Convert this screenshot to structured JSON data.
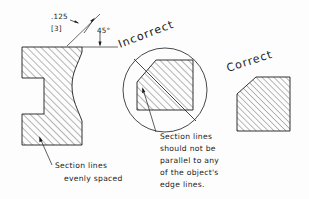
{
  "drawing": {
    "title": "Section lines (hatching) convention illustration",
    "background_color": "#fdfdfd",
    "line_color": "#1b1b1b",
    "dimension": {
      "value_inch": ".125",
      "value_metric": "[3]",
      "angle": "45°"
    },
    "labels": {
      "incorrect": "Incorrect",
      "correct": "Correct"
    },
    "notes": {
      "left_note_lines": [
        "Section lines",
        "evenly spaced"
      ],
      "center_note_lines": [
        "Section lines",
        "should not be",
        "parallel to any",
        "of the object's",
        "edge lines."
      ]
    },
    "objects": {
      "left_profile": {
        "name": "i-shaped-sectioned-part",
        "hatch_angle_deg": 45,
        "hatch_spacing_px": 5.0
      },
      "incorrect_block": {
        "name": "chamfered-square-incorrect",
        "hatch_angle_deg": 45,
        "hatch_spacing_px": 5.0,
        "marked_invalid": true
      },
      "correct_block": {
        "name": "chamfered-square-correct",
        "hatch_angle_deg": 45,
        "hatch_spacing_px": 4.2,
        "marked_invalid": false
      }
    }
  }
}
